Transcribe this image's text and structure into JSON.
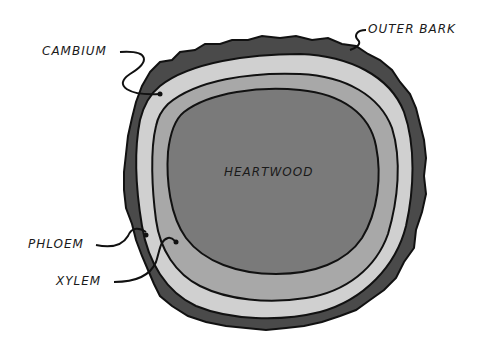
{
  "diagram": {
    "labels": {
      "outer_bark": "OUTER BARK",
      "cambium": "CAMBIUM",
      "heartwood": "HEARTWOOD",
      "phloem": "PHLOEM",
      "xylem": "XYLEM"
    },
    "colors": {
      "outer_bark": "#4a4a4a",
      "phloem": "#d0d0d0",
      "xylem": "#a8a8a8",
      "heartwood": "#7a7a7a",
      "outline": "#111111"
    }
  }
}
